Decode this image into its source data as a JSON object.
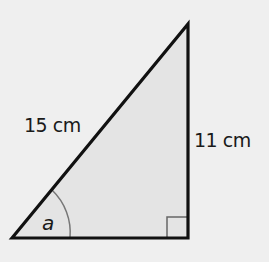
{
  "diagram": {
    "type": "right-triangle",
    "hypotenuse_label": "15 cm",
    "opposite_label": "11 cm",
    "angle_label": "a",
    "right_angle_marker": true,
    "colors": {
      "background": "#efefef",
      "fill": "#e4e4e4",
      "stroke": "#111111",
      "arc": "#777777"
    }
  }
}
